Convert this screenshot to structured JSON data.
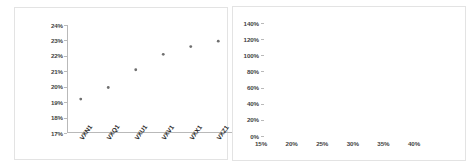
{
  "chart_data": [
    {
      "type": "scatter",
      "title": "",
      "xlabel": "",
      "ylabel": "",
      "categories": [
        "VXN1",
        "VXQ1",
        "VXU1",
        "VXV1",
        "VXX1",
        "VXZ1"
      ],
      "values": [
        19.2,
        19.95,
        21.1,
        22.1,
        22.6,
        22.95
      ],
      "ytick_labels": [
        "24%",
        "23%",
        "22%",
        "21%",
        "20%",
        "19%",
        "18%",
        "17%"
      ],
      "ytick_values": [
        24,
        23,
        22,
        21,
        20,
        19,
        18,
        17
      ],
      "ylim": [
        17,
        24
      ],
      "grid": false,
      "legend": "none",
      "marker_color": "#6f6f6f"
    },
    {
      "type": "line",
      "title": "",
      "xlabel": "",
      "ylabel": "",
      "xtick_labels": [
        "15%",
        "20%",
        "25%",
        "30%",
        "35%",
        "40%"
      ],
      "xtick_values": [
        15,
        20,
        25,
        30,
        35,
        40
      ],
      "ytick_labels": [
        "140%",
        "120%",
        "100%",
        "80%",
        "60%",
        "40%",
        "20%",
        "0%"
      ],
      "ytick_values": [
        140,
        120,
        100,
        80,
        60,
        40,
        20,
        0
      ],
      "xlim": [
        15,
        40
      ],
      "ylim": [
        0,
        140
      ],
      "grid": false,
      "legend": "right",
      "x": [
        15,
        17.5,
        20,
        22.5,
        25,
        27.5,
        30,
        32.5,
        35,
        37
      ],
      "series": [
        {
          "name": "VXN1",
          "color": "#8c8c8c",
          "values": [
            66,
            81,
            92,
            101,
            109,
            115,
            120,
            124,
            127,
            129
          ]
        },
        {
          "name": "VXQ1",
          "color": "#a3a3a3",
          "values": [
            55,
            66,
            75,
            83,
            89,
            95,
            99,
            103,
            106,
            108
          ]
        },
        {
          "name": "VXU1",
          "color": "#cfcfcf",
          "values": [
            49,
            57,
            64,
            70,
            75,
            79,
            83,
            86,
            89,
            91
          ]
        },
        {
          "name": "VXV1",
          "color": "#dcdcdc",
          "values": [
            46,
            52,
            58,
            63,
            67,
            71,
            74,
            77,
            79,
            81
          ]
        },
        {
          "name": "VXX1",
          "color": "#e4e4e4",
          "values": [
            44,
            49,
            54,
            58,
            62,
            65,
            68,
            70,
            72,
            74
          ]
        },
        {
          "name": "VXZ1",
          "color": "#ececec",
          "values": [
            43,
            47,
            51,
            55,
            58,
            61,
            63,
            65,
            67,
            68
          ]
        }
      ]
    }
  ],
  "left_chart": {
    "ytick_labels": [
      "24%",
      "23%",
      "22%",
      "21%",
      "20%",
      "19%",
      "18%",
      "17%"
    ],
    "xtick_labels": [
      "VXN1",
      "VXQ1",
      "VXU1",
      "VXV1",
      "VXX1",
      "VXZ1"
    ]
  },
  "right_chart": {
    "ytick_labels": [
      "140%",
      "120%",
      "100%",
      "80%",
      "60%",
      "40%",
      "20%",
      "0%"
    ],
    "xtick_labels": [
      "15%",
      "20%",
      "25%",
      "30%",
      "35%",
      "40%"
    ],
    "legend": [
      {
        "label": "VXN1",
        "color": "#8c8c8c"
      },
      {
        "label": "VXQ1",
        "color": "#a3a3a3"
      },
      {
        "label": "VXU1",
        "color": "#cfcfcf"
      },
      {
        "label": "VXV1",
        "color": "#dcdcdc"
      },
      {
        "label": "VXX1",
        "color": "#e4e4e4"
      },
      {
        "label": "VXZ1",
        "color": "#ececec"
      }
    ]
  }
}
